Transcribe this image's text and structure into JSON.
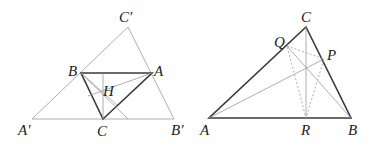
{
  "figures": [
    {
      "id": "left",
      "description": "Triangle ABC with orthocenter H inside its anticomplementary triangle A'B'C'",
      "labels": {
        "Cp": "C′",
        "B": "B",
        "A": "A",
        "H": "H",
        "Ap": "A′",
        "C": "C",
        "Bp": "B′"
      }
    },
    {
      "id": "right",
      "description": "Triangle ABC with altitude feet P, Q, R forming the orthic triangle (dashed)",
      "labels": {
        "C": "C",
        "Q": "Q",
        "P": "P",
        "A": "A",
        "R": "R",
        "B": "B"
      }
    }
  ]
}
